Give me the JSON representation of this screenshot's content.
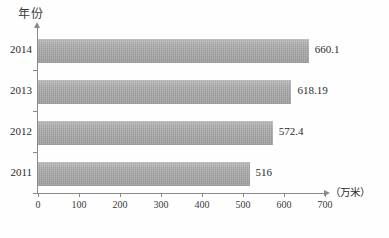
{
  "chart_data": {
    "type": "bar",
    "orientation": "horizontal",
    "title": "",
    "xlabel": "（万米）",
    "ylabel": "年份",
    "categories": [
      "2014",
      "2013",
      "2012",
      "2011"
    ],
    "values": [
      660.1,
      618.19,
      572.4,
      516
    ],
    "value_labels": [
      "660.1",
      "618.19",
      "572.4",
      "516"
    ],
    "xlim": [
      0,
      700
    ],
    "xticks": [
      0,
      100,
      200,
      300,
      400,
      500,
      600,
      700
    ],
    "xtick_labels": [
      "0",
      "100",
      "200",
      "300",
      "400",
      "500",
      "600",
      "700"
    ],
    "grid": false,
    "legend": null,
    "series": [
      {
        "name": "",
        "color": "#a9a9a9",
        "values": [
          660.1,
          618.19,
          572.4,
          516
        ]
      }
    ]
  },
  "axes": {
    "y_title": "年份",
    "x_unit": "（万米）"
  },
  "colors": {
    "bar_fill": "#a9a9a9",
    "axis_line": "#8a8a8a",
    "text": "#2b2b2b",
    "background": "#fefefe"
  }
}
